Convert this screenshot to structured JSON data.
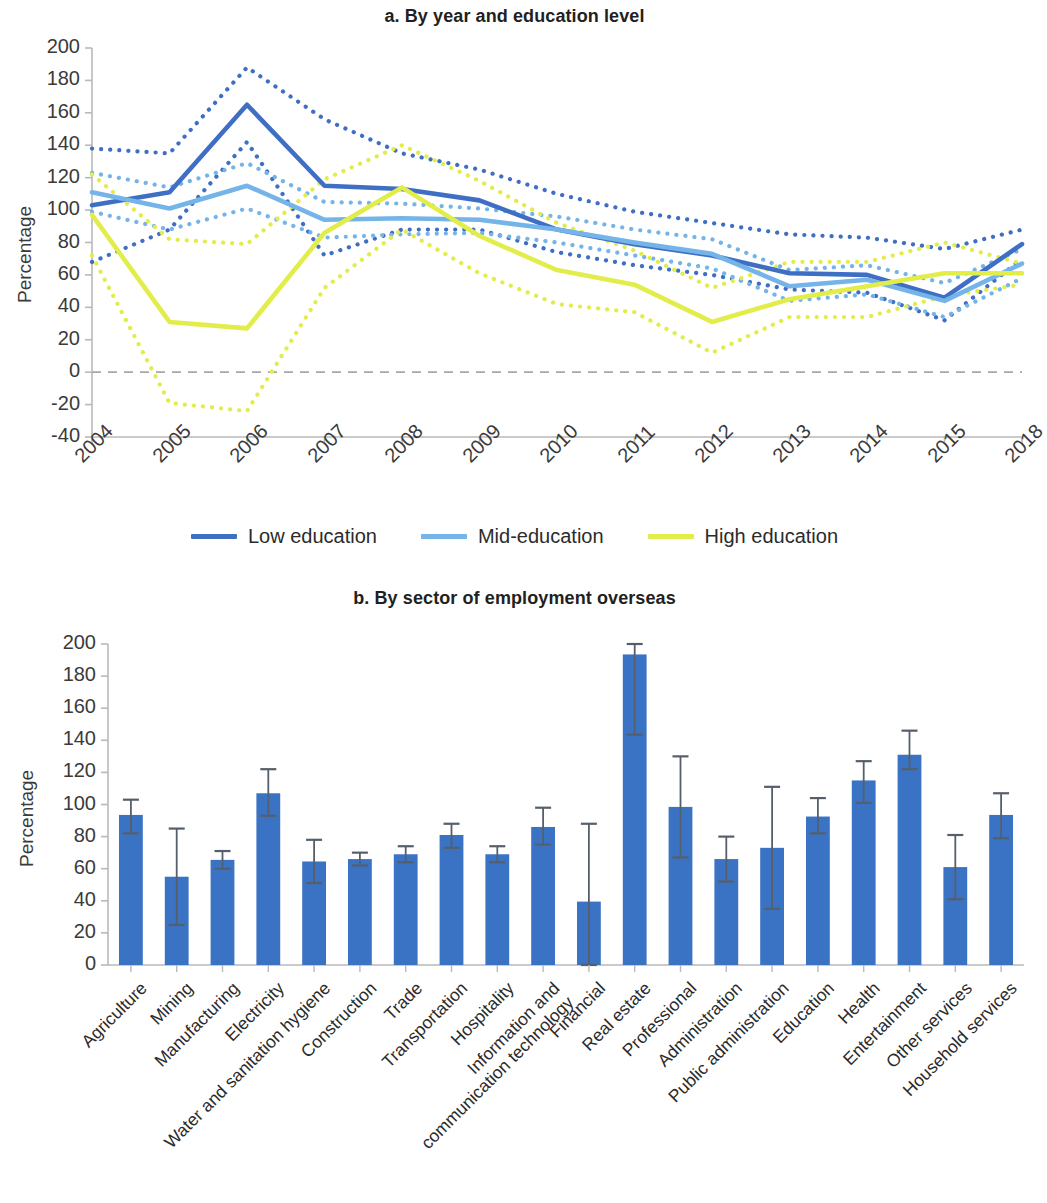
{
  "panel_a": {
    "title": "a. By year and education level",
    "ylabel": "Percentage",
    "legend": [
      {
        "label": "Low education",
        "color": "#3e6fc4"
      },
      {
        "label": "Mid-education",
        "color": "#74b4e8"
      },
      {
        "label": "High education",
        "color": "#e2ed4a"
      }
    ]
  },
  "panel_b": {
    "title": "b. By sector of employment overseas",
    "ylabel": "Percentage"
  },
  "chart_data": [
    {
      "type": "line",
      "title": "a. By year and education level",
      "xlabel": "",
      "ylabel": "Percentage",
      "ylim": [
        -40,
        200
      ],
      "yticks": [
        -40,
        -20,
        0,
        20,
        40,
        60,
        80,
        100,
        120,
        140,
        160,
        180,
        200
      ],
      "grid": false,
      "zero_line": true,
      "legend_position": "bottom",
      "x": [
        "2004",
        "2005",
        "2006",
        "2007",
        "2008",
        "2009",
        "2010",
        "2011",
        "2012",
        "2013",
        "2014",
        "2015",
        "2018"
      ],
      "series": [
        {
          "name": "Low education",
          "color": "#3e6fc4",
          "style": "solid",
          "values": [
            103,
            111,
            165,
            115,
            113,
            106,
            88,
            79,
            72,
            61,
            60,
            46,
            79
          ],
          "ci_upper": {
            "name": "Low education upper",
            "style": "dotted",
            "values": [
              138,
              135,
              188,
              156,
              135,
              125,
              110,
              99,
              92,
              85,
              83,
              76,
              88
            ]
          },
          "ci_lower": {
            "name": "Low education lower",
            "style": "dotted",
            "values": [
              68,
              88,
              142,
              72,
              88,
              88,
              74,
              66,
              60,
              51,
              49,
              32,
              70
            ]
          }
        },
        {
          "name": "Mid-education",
          "color": "#74b4e8",
          "style": "solid",
          "values": [
            111,
            101,
            115,
            94,
            95,
            94,
            88,
            80,
            73,
            53,
            57,
            44,
            67
          ],
          "ci_upper": {
            "name": "Mid-education upper",
            "style": "dotted",
            "values": [
              123,
              114,
              129,
              105,
              104,
              101,
              96,
              88,
              82,
              63,
              66,
              55,
              76
            ]
          },
          "ci_lower": {
            "name": "Mid-education lower",
            "style": "dotted",
            "values": [
              99,
              88,
              101,
              83,
              85,
              86,
              80,
              72,
              64,
              44,
              48,
              34,
              58
            ]
          }
        },
        {
          "name": "High education",
          "color": "#e2ed4a",
          "style": "solid",
          "values": [
            97,
            31,
            27,
            86,
            114,
            84,
            63,
            54,
            31,
            45,
            53,
            61,
            61
          ],
          "ci_upper": {
            "name": "High education upper",
            "style": "dotted",
            "values": [
              122,
              82,
              79,
              119,
              140,
              118,
              92,
              75,
              52,
              68,
              68,
              80,
              67
            ]
          },
          "ci_lower": {
            "name": "High education lower",
            "style": "dotted",
            "values": [
              72,
              -19,
              -24,
              52,
              88,
              61,
              42,
              37,
              12,
              34,
              34,
              47,
              54
            ]
          }
        }
      ]
    },
    {
      "type": "bar",
      "title": "b. By sector of employment overseas",
      "xlabel": "",
      "ylabel": "Percentage",
      "ylim": [
        0,
        200
      ],
      "yticks": [
        0,
        20,
        40,
        60,
        80,
        100,
        120,
        140,
        160,
        180,
        200
      ],
      "bar_color": "#3b73c4",
      "categories": [
        "Agriculture",
        "Mining",
        "Manufacturing",
        "Electricity",
        "Water and sanitation hygiene",
        "Construction",
        "Trade",
        "Transportation",
        "Hospitality",
        "Information and communication technology",
        "Financial",
        "Real estate",
        "Professional",
        "Administration",
        "Public administration",
        "Education",
        "Health",
        "Entertainment",
        "Other services",
        "Household services"
      ],
      "values": [
        93.5,
        55,
        65.5,
        107,
        64.5,
        66,
        69,
        81,
        69,
        86,
        39.5,
        193.5,
        98.5,
        66,
        73,
        92.5,
        115,
        131,
        61,
        93.5
      ],
      "err_low": [
        82,
        25,
        60,
        93,
        51,
        62,
        64,
        73,
        64,
        75,
        0,
        143.5,
        67,
        52,
        35,
        82,
        101,
        122,
        41,
        79
      ],
      "err_high": [
        103,
        85,
        71,
        122,
        78,
        70,
        74,
        88,
        74,
        98,
        88,
        200,
        130,
        80,
        111,
        104,
        127,
        146,
        81,
        107
      ]
    }
  ]
}
